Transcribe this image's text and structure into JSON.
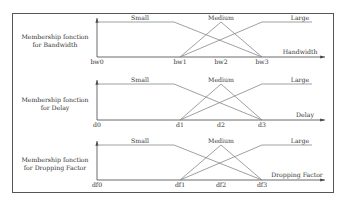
{
  "panels": [
    {
      "title_line1": "Membership fonction",
      "title_line2": "for Bandwidth",
      "axis_label": "Handwidth",
      "sets": [
        "Small",
        "Medium",
        "Large"
      ],
      "ticks": [
        "bw0",
        "bw1",
        "bw2",
        "bw3"
      ]
    },
    {
      "title_line1": "Membership fonction",
      "title_line2": "for Delay",
      "axis_label": "Delay",
      "sets": [
        "Small",
        "Medium",
        "Large"
      ],
      "ticks": [
        "d0",
        "d1",
        "d2",
        "d3"
      ]
    },
    {
      "title_line1": "Membership fonction",
      "title_line2": "for Dropping Factor",
      "axis_label": "Dropping Factor",
      "sets": [
        "Small",
        "Medium",
        "Large"
      ],
      "ticks": [
        "df0",
        "df1",
        "df2",
        "df3"
      ]
    }
  ],
  "colors": {
    "line": "#888888",
    "axis": "#444444",
    "frame": "#555555"
  }
}
